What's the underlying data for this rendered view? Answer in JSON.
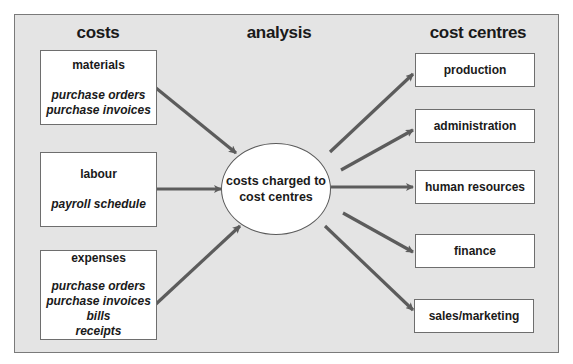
{
  "headings": {
    "costs": "costs",
    "analysis": "analysis",
    "cost_centres": "cost centres"
  },
  "costs": [
    {
      "title": "materials",
      "documents": [
        "purchase orders",
        "purchase invoices"
      ]
    },
    {
      "title": "labour",
      "documents": [
        "payroll schedule"
      ]
    },
    {
      "title": "expenses",
      "documents": [
        "purchase orders",
        "purchase invoices",
        "bills",
        "receipts"
      ]
    }
  ],
  "analysis": {
    "center_line1": "costs charged to",
    "center_line2": "cost centres"
  },
  "cost_centres": [
    {
      "label": "production"
    },
    {
      "label": "administration"
    },
    {
      "label": "human resources"
    },
    {
      "label": "finance"
    },
    {
      "label": "sales/marketing"
    }
  ],
  "colors": {
    "panel_background": "#e4e4e4",
    "arrow": "#5c5c5c",
    "box_background": "#ffffff",
    "border": "#6e6e6e"
  }
}
